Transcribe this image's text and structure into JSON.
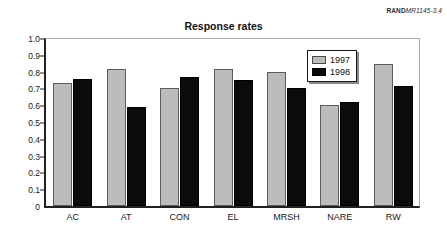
{
  "figure_id": {
    "rand_mark": "RAND",
    "doc_number": "MR1145-3.4"
  },
  "chart_data": {
    "type": "bar",
    "title": "Response rates",
    "xlabel": "",
    "ylabel": "",
    "ylim": [
      0,
      1.0
    ],
    "grid": false,
    "legend_position": "inside-top-right",
    "categories": [
      "AC",
      "AT",
      "CON",
      "EL",
      "MRSH",
      "NARE",
      "RW"
    ],
    "y_tick_labels": [
      "0",
      "0.1",
      "0.2",
      "0.3",
      "0.4",
      "0.5",
      "0.6",
      "0.7",
      "0.8",
      "0.9",
      "1.0"
    ],
    "y_tick_values": [
      0,
      0.1,
      0.2,
      0.3,
      0.4,
      0.5,
      0.6,
      0.7,
      0.8,
      0.9,
      1.0
    ],
    "series": [
      {
        "name": "1997",
        "color": "#bcbcbc",
        "values": [
          0.73,
          0.815,
          0.705,
          0.815,
          0.8,
          0.6,
          0.845
        ]
      },
      {
        "name": "1998",
        "color": "#0b0b0b",
        "values": [
          0.755,
          0.59,
          0.765,
          0.75,
          0.7,
          0.62,
          0.715
        ]
      }
    ]
  }
}
